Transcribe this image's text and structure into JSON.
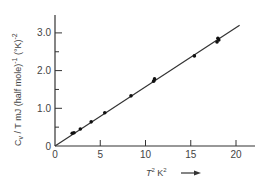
{
  "chart_data": {
    "type": "scatter",
    "title": "",
    "xlabel": "T² K²",
    "ylabel": "C_v / T mJ (half mole)^-1 (°K)^-2",
    "xlim": [
      0,
      22
    ],
    "ylim": [
      0,
      3.5
    ],
    "x_ticks": [
      0,
      5,
      10,
      15,
      20
    ],
    "x_tick_labels": [
      "0",
      "5",
      "10",
      "15",
      "20"
    ],
    "y_ticks": [
      0,
      0.5,
      1.0,
      1.5,
      2.0,
      2.5,
      3.0
    ],
    "y_tick_labels": [
      "0",
      "",
      "1.0",
      "",
      "2.0",
      "",
      "3.0"
    ],
    "grid": false,
    "legend": null,
    "series": [
      {
        "name": "measured",
        "marker": "dot",
        "x": [
          1.9,
          2.1,
          2.8,
          4.0,
          5.5,
          8.4,
          10.9,
          11.0,
          15.4,
          17.9,
          18.0,
          18.1
        ],
        "y": [
          0.34,
          0.35,
          0.45,
          0.64,
          0.88,
          1.33,
          1.72,
          1.78,
          2.39,
          2.76,
          2.86,
          2.81
        ]
      },
      {
        "name": "linear fit",
        "marker": "line",
        "x": [
          0,
          20.4
        ],
        "y": [
          0,
          3.2
        ]
      }
    ],
    "annotations": [
      "arrow pointing right after x-axis label"
    ]
  },
  "labels": {
    "y_label_main": "C",
    "y_label_sub": "v",
    "y_label_rest": " / T  mJ (half mole)",
    "y_label_exp1": "-1",
    "y_label_unit": " (°K)",
    "y_label_exp2": "-2",
    "x_label_T": "T",
    "x_label_T_exp": "2",
    "x_label_K": " K",
    "x_label_K_exp": "2"
  },
  "colors": {
    "ink": "#333333",
    "background": "#ffffff"
  }
}
